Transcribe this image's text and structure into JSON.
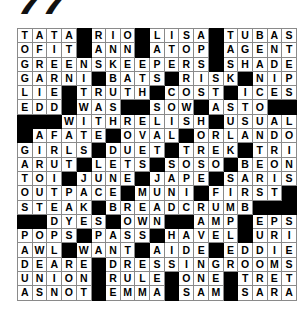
{
  "page": {
    "puzzle_number": "77",
    "type": "crossword-solution-grid",
    "columns": 17,
    "rows": 19,
    "fill_color": "#ffffff",
    "block_color": "#000000",
    "grid_line_color": "#8a8a8a",
    "letter_color": "#000000"
  },
  "grid": {
    "rows": [
      [
        "T",
        "A",
        "T",
        "A",
        "#",
        "R",
        "I",
        "O",
        "#",
        "L",
        "I",
        "S",
        "A",
        "#",
        "T",
        "U",
        "B",
        "A",
        "S"
      ],
      [
        "O",
        "F",
        "I",
        "T",
        "#",
        "A",
        "N",
        "N",
        "#",
        "A",
        "T",
        "O",
        "P",
        "#",
        "A",
        "G",
        "E",
        "N",
        "T"
      ],
      [
        "G",
        "R",
        "E",
        "E",
        "N",
        "S",
        "K",
        "E",
        "E",
        "P",
        "E",
        "R",
        "S",
        "#",
        "S",
        "H",
        "A",
        "D",
        "E"
      ],
      [
        "G",
        "A",
        "R",
        "N",
        "I",
        "#",
        "B",
        "A",
        "T",
        "S",
        "#",
        "R",
        "I",
        "S",
        "K",
        "#",
        "N",
        "I",
        "P"
      ],
      [
        "L",
        "I",
        "E",
        "#",
        "T",
        "R",
        "U",
        "T",
        "H",
        "#",
        "C",
        "O",
        "S",
        "T",
        "#",
        "I",
        "C",
        "E",
        "S"
      ],
      [
        "E",
        "D",
        "D",
        "#",
        "W",
        "A",
        "S",
        "#",
        "#",
        "S",
        "O",
        "W",
        "#",
        "A",
        "S",
        "T",
        "O",
        "#",
        "#"
      ],
      [
        "#",
        "#",
        "#",
        "W",
        "I",
        "T",
        "H",
        "R",
        "E",
        "L",
        "I",
        "S",
        "H",
        "#",
        "U",
        "S",
        "U",
        "A",
        "L"
      ],
      [
        "#",
        "A",
        "F",
        "A",
        "T",
        "E",
        "#",
        "O",
        "V",
        "A",
        "L",
        "#",
        "O",
        "R",
        "L",
        "A",
        "N",
        "D",
        "O"
      ],
      [
        "G",
        "I",
        "R",
        "L",
        "S",
        "#",
        "D",
        "U",
        "E",
        "T",
        "#",
        "T",
        "R",
        "E",
        "K",
        "#",
        "T",
        "R",
        "I"
      ],
      [
        "A",
        "R",
        "U",
        "T",
        "#",
        "L",
        "E",
        "T",
        "S",
        "#",
        "S",
        "O",
        "S",
        "O",
        "#",
        "B",
        "E",
        "O",
        "N"
      ],
      [
        "T",
        "O",
        "I",
        "#",
        "J",
        "U",
        "N",
        "E",
        "#",
        "J",
        "A",
        "P",
        "E",
        "#",
        "S",
        "A",
        "R",
        "I",
        "S"
      ],
      [
        "O",
        "U",
        "T",
        "P",
        "A",
        "C",
        "E",
        "#",
        "M",
        "U",
        "N",
        "I",
        "#",
        "F",
        "I",
        "R",
        "S",
        "T",
        "#"
      ],
      [
        "S",
        "T",
        "E",
        "A",
        "K",
        "#",
        "B",
        "R",
        "E",
        "A",
        "D",
        "C",
        "R",
        "U",
        "M",
        "B",
        "#",
        "#",
        "#"
      ],
      [
        "#",
        "#",
        "D",
        "Y",
        "E",
        "S",
        "#",
        "O",
        "W",
        "N",
        "#",
        "#",
        "A",
        "M",
        "P",
        "#",
        "E",
        "P",
        "S"
      ],
      [
        "P",
        "O",
        "P",
        "S",
        "#",
        "P",
        "A",
        "S",
        "S",
        "#",
        "H",
        "A",
        "V",
        "E",
        "L",
        "#",
        "U",
        "R",
        "I"
      ],
      [
        "A",
        "W",
        "L",
        "#",
        "W",
        "A",
        "N",
        "T",
        "#",
        "A",
        "I",
        "D",
        "E",
        "#",
        "E",
        "D",
        "D",
        "I",
        "E"
      ],
      [
        "D",
        "E",
        "A",
        "R",
        "E",
        "#",
        "D",
        "R",
        "E",
        "S",
        "S",
        "I",
        "N",
        "G",
        "R",
        "O",
        "O",
        "M",
        "S"
      ],
      [
        "U",
        "N",
        "I",
        "O",
        "N",
        "#",
        "R",
        "U",
        "L",
        "E",
        "#",
        "O",
        "N",
        "E",
        "#",
        "T",
        "R",
        "E",
        "T"
      ],
      [
        "A",
        "S",
        "N",
        "O",
        "T",
        "#",
        "E",
        "M",
        "M",
        "A",
        "#",
        "S",
        "A",
        "M",
        "#",
        "S",
        "A",
        "R",
        "A"
      ]
    ]
  },
  "answers": {
    "across_words_visible": [
      "TATA",
      "RIO",
      "LISA",
      "TUBAS",
      "OFIT",
      "ANN",
      "ATOP",
      "AGENT",
      "GREENSKEEPERS",
      "SHADE",
      "GARNI",
      "BATS",
      "RISK",
      "NIP",
      "LIE",
      "TRUTH",
      "COST",
      "ICES",
      "EDD",
      "WAS",
      "SOW",
      "ASTO",
      "WITHRELISH",
      "USUAL",
      "AFATE",
      "OVAL",
      "ORLANDO",
      "GIRLS",
      "DUET",
      "TREK",
      "TRI",
      "ARUT",
      "LETS",
      "SOSO",
      "BEON",
      "TOI",
      "JUNE",
      "JAPE",
      "SARIS",
      "OUTPACE",
      "MUNI",
      "FIRST",
      "STEAK",
      "BREADCRUMB",
      "DYES",
      "OWN",
      "AMP",
      "EPS",
      "POPS",
      "PASS",
      "HAVEL",
      "URI",
      "AWL",
      "WANT",
      "AIDE",
      "EDDIE",
      "DEARE",
      "DRESSINGROOMS",
      "UNION",
      "RULE",
      "ONE",
      "TRET",
      "ASNOT",
      "EMMA",
      "SAM",
      "SARA"
    ]
  }
}
